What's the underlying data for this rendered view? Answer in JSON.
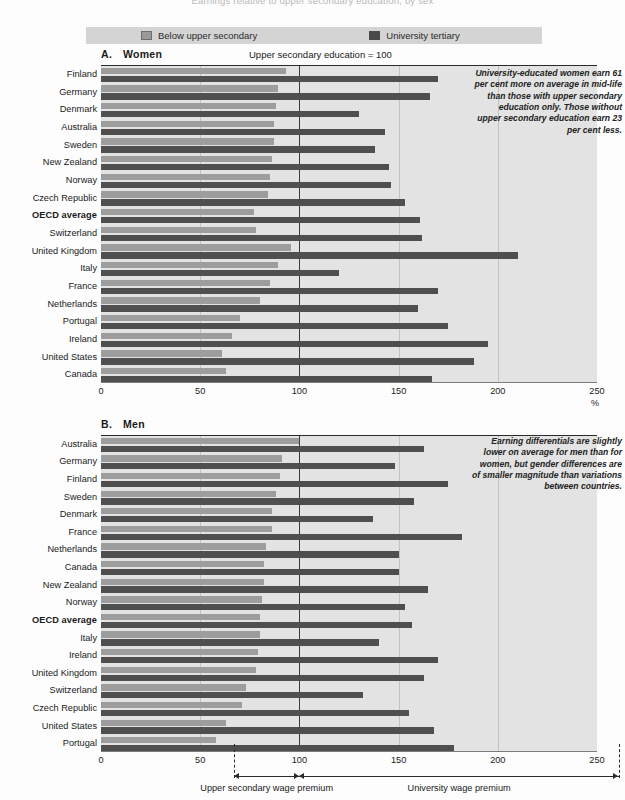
{
  "top_title": "Earnings relative to upper secondary education, by sex",
  "legend": {
    "items": [
      {
        "label": "Below upper secondary",
        "color": "#9d9d9d",
        "icon": "legend-swatch-below-upper-secondary"
      },
      {
        "label": "University tertiary",
        "color": "#4f4f4f",
        "icon": "legend-swatch-university-tertiary"
      }
    ]
  },
  "axis": {
    "ticks": [
      "0",
      "50",
      "100",
      "150",
      "200",
      "250"
    ],
    "tick_values": [
      0,
      50,
      100,
      150,
      200,
      250
    ],
    "unit": "%",
    "min": 0,
    "max": 250
  },
  "panel_a": {
    "letter": "A.",
    "name": "Women",
    "note": "Upper secondary education = 100",
    "annotation": "University-educated women earn 61 per cent more on average in mid-life than those with upper secondary education only. Those without upper secondary education earn 23 per cent less."
  },
  "panel_b": {
    "letter": "B.",
    "name": "Men",
    "annotation": "Earning differentials are slightly lower on average for men than for women, but gender differences are of smaller magnitude than variations between countries."
  },
  "brackets": {
    "left_label": "Upper secondary wage premium",
    "right_label": "University wage premium",
    "left_start": 67,
    "right_end": 261
  },
  "chart_data": [
    {
      "type": "bar",
      "orientation": "horizontal",
      "title": "A. Women",
      "subtitle": "Upper secondary education = 100",
      "xlabel": "%",
      "ylabel": "",
      "xlim": [
        0,
        250
      ],
      "reference_line": 100,
      "grid": true,
      "legend_position": "top",
      "categories": [
        "Finland",
        "Germany",
        "Denmark",
        "Australia",
        "Sweden",
        "New Zealand",
        "Norway",
        "Czech Republic",
        "OECD average",
        "Switzerland",
        "United Kingdom",
        "Italy",
        "France",
        "Netherlands",
        "Portugal",
        "Ireland",
        "United States",
        "Canada"
      ],
      "series": [
        {
          "name": "Below upper secondary",
          "color": "#9d9d9d",
          "values": [
            93,
            89,
            88,
            87,
            87,
            86,
            85,
            84,
            77,
            78,
            96,
            89,
            85,
            80,
            70,
            66,
            61,
            63
          ]
        },
        {
          "name": "University tertiary",
          "color": "#4f4f4f",
          "values": [
            170,
            166,
            130,
            143,
            138,
            145,
            146,
            153,
            161,
            162,
            210,
            120,
            170,
            160,
            175,
            195,
            188,
            167
          ]
        }
      ]
    },
    {
      "type": "bar",
      "orientation": "horizontal",
      "title": "B. Men",
      "xlabel": "",
      "ylabel": "",
      "xlim": [
        0,
        250
      ],
      "reference_line": 100,
      "grid": true,
      "legend_position": "top",
      "categories": [
        "Australia",
        "Germany",
        "Finland",
        "Sweden",
        "Denmark",
        "France",
        "Netherlands",
        "Canada",
        "New Zealand",
        "Norway",
        "OECD average",
        "Italy",
        "Ireland",
        "United Kingdom",
        "Switzerland",
        "Czech Republic",
        "United States",
        "Portugal"
      ],
      "series": [
        {
          "name": "Below upper secondary",
          "color": "#9d9d9d",
          "values": [
            100,
            91,
            90,
            88,
            86,
            86,
            83,
            82,
            82,
            81,
            80,
            80,
            79,
            78,
            73,
            71,
            63,
            58
          ]
        },
        {
          "name": "University tertiary",
          "color": "#4f4f4f",
          "values": [
            163,
            148,
            175,
            158,
            137,
            182,
            150,
            150,
            165,
            153,
            157,
            140,
            170,
            163,
            132,
            155,
            168,
            178
          ]
        }
      ]
    }
  ]
}
